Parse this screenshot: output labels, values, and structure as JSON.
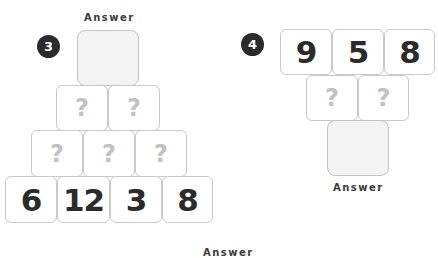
{
  "puzzle3": {
    "number": "3",
    "answer_label": "Answer",
    "rows": [
      [
        "?",
        "?"
      ],
      [
        "?",
        "?",
        "?"
      ],
      [
        "6",
        "12",
        "3",
        "8"
      ]
    ]
  },
  "puzzle4": {
    "number": "4",
    "answer_label": "Answer",
    "rows": [
      [
        "9",
        "5",
        "8"
      ],
      [
        "?",
        "?"
      ]
    ]
  },
  "footer": {
    "answer_label": "Answer"
  },
  "colors": {
    "badge": "#2b2b2b",
    "number_text": "#2b2b2b",
    "question_mark": "#c2c2c2",
    "box_border": "#c9c9c9",
    "answer_fill": "#f3f3f3"
  }
}
